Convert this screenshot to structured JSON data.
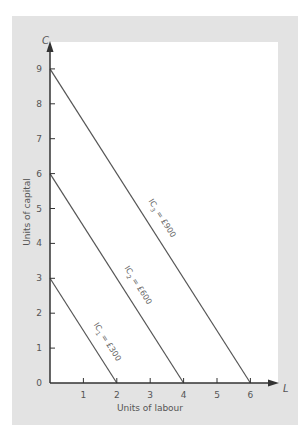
{
  "chart_data": {
    "type": "line",
    "title": "",
    "xlabel": "Units of labour",
    "ylabel": "Units of capital",
    "x_axis_letter": "L",
    "y_axis_letter": "C",
    "xlim": [
      0,
      7
    ],
    "ylim": [
      0,
      10
    ],
    "x_ticks": [
      1,
      2,
      3,
      4,
      5,
      6
    ],
    "y_ticks": [
      0,
      1,
      2,
      3,
      4,
      5,
      6,
      7,
      8,
      9
    ],
    "grid": false,
    "legend": "none",
    "series": [
      {
        "name": "IC1 = £300",
        "label_main": "IC",
        "label_sub": "1",
        "label_rest": " = £300",
        "points": [
          [
            0,
            3
          ],
          [
            2,
            0
          ]
        ]
      },
      {
        "name": "IC2 = £600",
        "label_main": "IC",
        "label_sub": "2",
        "label_rest": " = £600",
        "points": [
          [
            0,
            6
          ],
          [
            4,
            0
          ]
        ]
      },
      {
        "name": "IC3 = £900",
        "label_main": "IC",
        "label_sub": "3",
        "label_rest": " = £900",
        "points": [
          [
            0,
            9
          ],
          [
            6,
            0
          ]
        ]
      }
    ],
    "colors": {
      "frame": "#e3e3e3",
      "plot": "#ffffff",
      "axis": "#333333",
      "line": "#555555"
    }
  }
}
